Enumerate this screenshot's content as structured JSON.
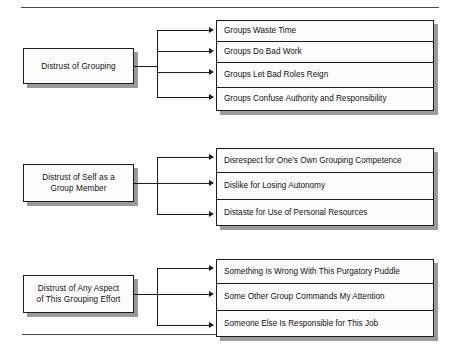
{
  "figure": {
    "type": "hierarchy-diagram",
    "orientation": "left-to-right",
    "rules": {
      "top": "horizontal-rule",
      "bottom": "horizontal-rule"
    }
  },
  "groups": [
    {
      "parent": "Distrust of Grouping",
      "children": [
        "Groups Waste Time",
        "Groups Do Bad Work",
        "Groups Let Bad Roles Reign",
        "Groups Confuse Authority and Responsibility"
      ]
    },
    {
      "parent": "Distrust of Self as a\nGroup Member",
      "parent_line1": "Distrust of Self as a",
      "parent_line2": "Group Member",
      "children": [
        "Disrespect for One's Own Grouping Competence",
        "Dislike for Losing Autonomy",
        "Distaste for Use of Personal Resources"
      ]
    },
    {
      "parent": "Distrust of Any Aspect\nof This Grouping Effort",
      "parent_line1": "Distrust of Any Aspect",
      "parent_line2": "of This Grouping Effort",
      "children": [
        "Something Is Wrong With This Purgatory Puddle",
        "Some Other Group Commands My Attention",
        "Someone Else Is Responsible for This Job"
      ]
    }
  ],
  "colors": {
    "ink": "#1c1c1c",
    "shadow": "#9a9a9a",
    "box_fill": "#fdfdfd",
    "rule": "#4a4a4a",
    "page": "#ffffff"
  }
}
